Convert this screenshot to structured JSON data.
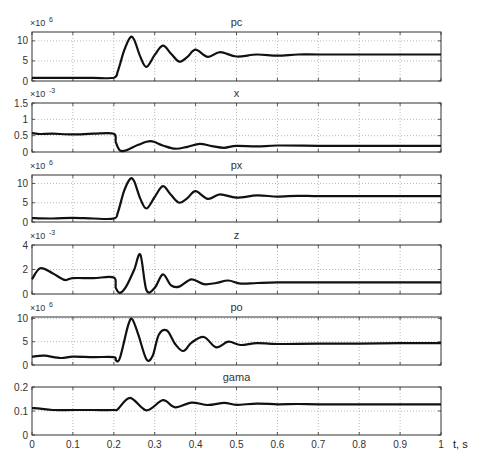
{
  "chart_data": [
    {
      "type": "line",
      "title": "pc",
      "exponent_label": "×10^6",
      "exponent": "6",
      "xlabel": "",
      "ylabel": "",
      "xlim": [
        0,
        1
      ],
      "ylim": [
        0,
        12.2
      ],
      "yticks": [
        0,
        5,
        10
      ],
      "ytick_labels": [
        "0",
        "5",
        "10"
      ],
      "grid": true,
      "x": [
        0,
        0.05,
        0.1,
        0.15,
        0.2,
        0.21,
        0.225,
        0.24,
        0.25,
        0.265,
        0.28,
        0.3,
        0.32,
        0.34,
        0.36,
        0.38,
        0.4,
        0.43,
        0.46,
        0.5,
        0.55,
        0.6,
        0.65,
        0.7,
        0.8,
        0.9,
        1.0
      ],
      "values": [
        0.8,
        0.8,
        0.8,
        0.8,
        0.8,
        2.5,
        7.5,
        10.8,
        10.2,
        6.0,
        3.5,
        6.5,
        8.8,
        6.8,
        4.8,
        6.0,
        7.8,
        6.0,
        7.2,
        6.1,
        6.6,
        6.3,
        6.6,
        6.6,
        6.6,
        6.6,
        6.6
      ]
    },
    {
      "type": "line",
      "title": "x",
      "exponent_label": "×10^-3",
      "exponent": "-3",
      "xlim": [
        0,
        1
      ],
      "ylim": [
        0,
        1.5
      ],
      "yticks": [
        0,
        0.5,
        1,
        1.5
      ],
      "ytick_labels": [
        "0",
        "0.5",
        "1",
        "1.5"
      ],
      "grid": true,
      "x": [
        0,
        0.02,
        0.05,
        0.1,
        0.15,
        0.2,
        0.205,
        0.215,
        0.23,
        0.26,
        0.29,
        0.32,
        0.35,
        0.38,
        0.41,
        0.44,
        0.47,
        0.5,
        0.55,
        0.6,
        0.7,
        0.8,
        0.9,
        1.0
      ],
      "values": [
        0.58,
        0.55,
        0.56,
        0.54,
        0.56,
        0.56,
        0.3,
        0.05,
        0.05,
        0.22,
        0.33,
        0.2,
        0.1,
        0.16,
        0.25,
        0.18,
        0.13,
        0.19,
        0.17,
        0.2,
        0.19,
        0.19,
        0.19,
        0.19
      ]
    },
    {
      "type": "line",
      "title": "px",
      "exponent_label": "×10^6",
      "exponent": "6",
      "xlim": [
        0,
        1
      ],
      "ylim": [
        0,
        12.2
      ],
      "yticks": [
        0,
        5,
        10
      ],
      "ytick_labels": [
        "0",
        "5",
        "10"
      ],
      "grid": true,
      "x": [
        0,
        0.05,
        0.1,
        0.15,
        0.2,
        0.21,
        0.225,
        0.24,
        0.25,
        0.265,
        0.28,
        0.3,
        0.32,
        0.34,
        0.36,
        0.38,
        0.4,
        0.43,
        0.46,
        0.5,
        0.55,
        0.6,
        0.65,
        0.7,
        0.8,
        0.9,
        1.0
      ],
      "values": [
        1.0,
        0.9,
        1.1,
        0.9,
        0.9,
        2.5,
        8.0,
        11.2,
        10.5,
        6.0,
        3.5,
        6.5,
        9.3,
        7.0,
        5.0,
        6.2,
        8.0,
        6.0,
        7.2,
        6.3,
        6.9,
        6.6,
        6.8,
        6.7,
        6.7,
        6.7,
        6.7
      ]
    },
    {
      "type": "line",
      "title": "z",
      "exponent_label": "×10^-3",
      "exponent": "-3",
      "xlim": [
        0,
        1
      ],
      "ylim": [
        0,
        4
      ],
      "yticks": [
        0,
        2,
        4
      ],
      "ytick_labels": [
        "0",
        "2",
        "4"
      ],
      "grid": true,
      "x": [
        0,
        0.02,
        0.05,
        0.08,
        0.1,
        0.15,
        0.2,
        0.205,
        0.215,
        0.23,
        0.25,
        0.265,
        0.28,
        0.3,
        0.32,
        0.34,
        0.36,
        0.39,
        0.42,
        0.45,
        0.48,
        0.51,
        0.55,
        0.6,
        0.7,
        0.8,
        0.9,
        1.0
      ],
      "values": [
        1.2,
        2.1,
        1.7,
        1.15,
        1.3,
        1.3,
        1.35,
        0.5,
        0.1,
        0.6,
        2.0,
        3.2,
        0.3,
        0.5,
        1.6,
        0.7,
        0.6,
        1.2,
        0.8,
        0.9,
        1.1,
        0.85,
        0.9,
        0.95,
        0.95,
        0.95,
        0.95,
        0.95
      ]
    },
    {
      "type": "line",
      "title": "po",
      "exponent_label": "×10^6",
      "exponent": "6",
      "xlim": [
        0,
        1
      ],
      "ylim": [
        0,
        10.3
      ],
      "yticks": [
        0,
        5,
        10
      ],
      "ytick_labels": [
        "0",
        "5",
        "10"
      ],
      "grid": true,
      "x": [
        0,
        0.03,
        0.07,
        0.1,
        0.15,
        0.2,
        0.205,
        0.215,
        0.235,
        0.245,
        0.26,
        0.28,
        0.295,
        0.31,
        0.33,
        0.35,
        0.37,
        0.39,
        0.42,
        0.45,
        0.48,
        0.51,
        0.55,
        0.6,
        0.7,
        0.8,
        0.9,
        1.0
      ],
      "values": [
        1.8,
        2.0,
        1.5,
        1.8,
        1.7,
        1.7,
        1.0,
        1.5,
        8.5,
        9.8,
        6.5,
        1.2,
        2.0,
        6.5,
        7.4,
        4.5,
        3.0,
        4.8,
        6.0,
        3.8,
        5.0,
        4.3,
        4.7,
        4.5,
        4.6,
        4.6,
        4.7,
        4.7
      ]
    },
    {
      "type": "line",
      "title": "gama",
      "xlim": [
        0,
        1
      ],
      "ylim": [
        0,
        0.2
      ],
      "yticks": [
        0,
        0.1,
        0.2
      ],
      "ytick_labels": [
        "0",
        "0.1",
        "0.2"
      ],
      "xticks": [
        0,
        0.1,
        0.2,
        0.3,
        0.4,
        0.5,
        0.6,
        0.7,
        0.8,
        0.9,
        1
      ],
      "xtick_labels": [
        "0",
        "0.1",
        "0.2",
        "0.3",
        "0.4",
        "0.5",
        "0.6",
        "0.7",
        "0.8",
        "0.9",
        "1"
      ],
      "xlabel": "t, s",
      "grid": true,
      "x": [
        0,
        0.02,
        0.05,
        0.1,
        0.15,
        0.2,
        0.21,
        0.24,
        0.28,
        0.32,
        0.35,
        0.39,
        0.43,
        0.47,
        0.5,
        0.55,
        0.6,
        0.65,
        0.7,
        0.8,
        0.9,
        1.0
      ],
      "values": [
        0.112,
        0.11,
        0.104,
        0.104,
        0.104,
        0.104,
        0.108,
        0.155,
        0.103,
        0.145,
        0.115,
        0.135,
        0.125,
        0.134,
        0.126,
        0.131,
        0.128,
        0.129,
        0.128,
        0.128,
        0.128,
        0.128
      ]
    }
  ],
  "x_axis_label": "t, s"
}
